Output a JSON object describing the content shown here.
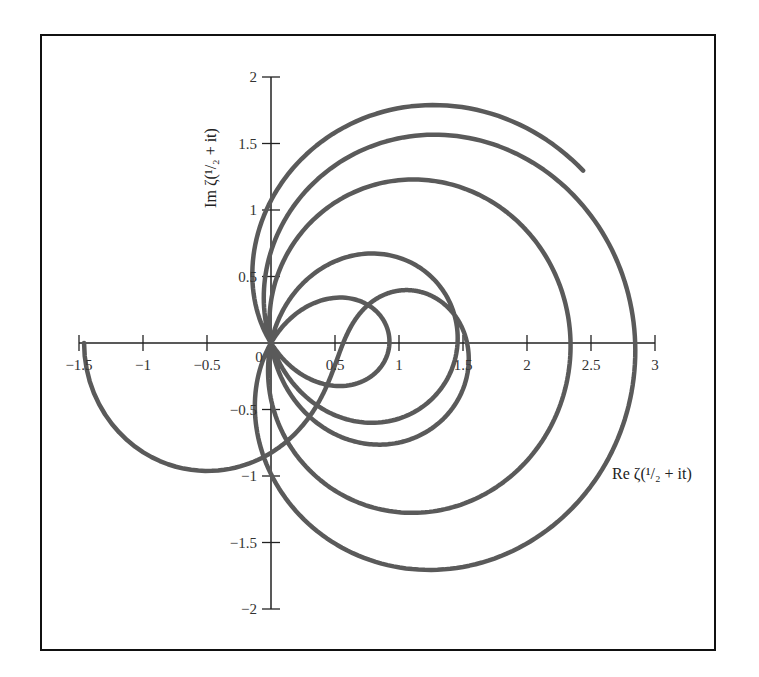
{
  "chart_data": {
    "type": "line",
    "title": "",
    "xlabel": "Re ζ(¹/₂ + it)",
    "ylabel": "Im ζ(¹/₂ + it)",
    "xlim": [
      -1.5,
      3
    ],
    "ylim": [
      -2,
      2
    ],
    "x_ticks": [
      "−1.5",
      "−1",
      "−0.5",
      "0",
      "0.5",
      "1",
      "1.5",
      "2",
      "2.5",
      "3"
    ],
    "x_tick_values": [
      -1.5,
      -1,
      -0.5,
      0,
      0.5,
      1,
      1.5,
      2,
      2.5,
      3
    ],
    "y_ticks": [
      "−2",
      "−1.5",
      "−1",
      "−0.5",
      "0.5",
      "1",
      "1.5",
      "2"
    ],
    "y_tick_values": [
      -2,
      -1.5,
      -1,
      -0.5,
      0.5,
      1,
      1.5,
      2
    ],
    "origin_label": "0",
    "grid": false,
    "legend": null,
    "series": [
      {
        "name": "ζ(1/2 + it)",
        "param": "t",
        "t_range": [
          0,
          34.9
        ],
        "color": "#5a5a5a",
        "key_points": [
          {
            "t": 0,
            "re": -1.46,
            "im": 0
          },
          {
            "t": 14.13,
            "re": 0,
            "im": 0
          },
          {
            "t": 21.02,
            "re": 0,
            "im": 0
          },
          {
            "t": 25.01,
            "re": 0,
            "im": 0
          },
          {
            "t": 30.42,
            "re": 0,
            "im": 0
          },
          {
            "t": 32.94,
            "re": 0,
            "im": 0
          },
          {
            "t": 34.9,
            "re": 0.5,
            "im": 1.58
          }
        ]
      }
    ]
  },
  "plot": {
    "origin_px": [
      271,
      343
    ],
    "px_per_unit_x": 128,
    "px_per_unit_y": 133,
    "curve_color": "#5a5a5a",
    "axis_color": "#222222"
  }
}
